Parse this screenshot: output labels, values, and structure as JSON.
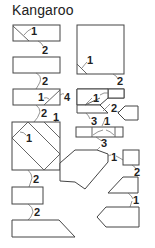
{
  "title": "Kangaroo",
  "colors": {
    "line": "#444444",
    "text": "#222222",
    "background": "#ffffff"
  },
  "steps": {
    "left": [
      {
        "id": "L1",
        "shape": "rectangle-with-corner-fold",
        "fold_labels": [
          "1"
        ],
        "next_label": "2"
      },
      {
        "id": "L2",
        "shape": "rectangle",
        "next_label": "2"
      },
      {
        "id": "L3",
        "shape": "rectangle-with-diagonal-fold",
        "fold_labels": [
          "1"
        ],
        "side_label": "4",
        "next_labels": [
          "2",
          "1"
        ]
      },
      {
        "id": "L4",
        "shape": "square-with-diagonal-folds",
        "fold_labels": [
          "1"
        ],
        "next_label": "2"
      },
      {
        "id": "L5",
        "shape": "small-rectangle",
        "next_label": "2"
      },
      {
        "id": "L6",
        "shape": "trapezoid"
      }
    ],
    "right": [
      {
        "id": "R1",
        "shape": "large-square-with-corner-fold",
        "fold_labels": [
          "1"
        ],
        "next_label": "2"
      },
      {
        "id": "R2",
        "shape": "stepped-composite",
        "fold_labels": [
          "1"
        ],
        "side_label": "2",
        "next_labels": [
          "3",
          "1"
        ]
      },
      {
        "id": "R2b",
        "shape": "pointed-pentagon"
      },
      {
        "id": "R3",
        "shape": "flat-rectangle-with-folds",
        "next_label": "3"
      },
      {
        "id": "R4",
        "shape": "octagon-body",
        "side_label": "1"
      },
      {
        "id": "R5",
        "shape": "small-square",
        "next_label": "2"
      },
      {
        "id": "R6",
        "shape": "slanted-trapezoid",
        "next_label": "1"
      },
      {
        "id": "R7",
        "shape": "pointed-pentagon-left"
      }
    ]
  },
  "labels": {
    "l1_fold": "1",
    "l1_next": "2",
    "l2_next": "2",
    "l3_fold": "1",
    "l3_side": "4",
    "l3_next_a": "2",
    "l3_next_b": "1",
    "l4_fold": "1",
    "l4_next": "2",
    "l5_next": "2",
    "r1_fold": "1",
    "r1_next": "2",
    "r2_fold": "1",
    "r2_side": "2",
    "r2_next_a": "3",
    "r2_next_b": "1",
    "r3_next": "3",
    "r4_side": "1",
    "r5_next": "2",
    "r6_next": "1"
  }
}
